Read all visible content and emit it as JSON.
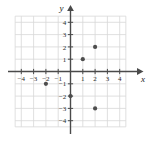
{
  "figure": {
    "name": "coordinate-plane-scatter",
    "width": 149,
    "height": 142,
    "background_color": "#ffffff"
  },
  "axes": {
    "x_label": "x",
    "y_label": "y",
    "x_tick_labels": [
      "−4",
      "−3",
      "−2",
      "−1",
      "1",
      "2",
      "3",
      "4"
    ],
    "y_tick_labels": [
      "4",
      "3",
      "2",
      "1",
      "−1",
      "−2",
      "−3",
      "−4"
    ],
    "axis_color": "#4a4a4a",
    "grid_color": "#d8d8d8"
  },
  "chart_data": {
    "type": "scatter",
    "title": "",
    "xlabel": "x",
    "ylabel": "y",
    "xlim": [
      -5,
      5
    ],
    "ylim": [
      -5,
      5
    ],
    "grid": true,
    "legend": false,
    "xticks": [
      -4,
      -3,
      -2,
      -1,
      1,
      2,
      3,
      4
    ],
    "yticks": [
      4,
      3,
      2,
      1,
      -1,
      -2,
      -3,
      -4
    ],
    "point_color": "#4d4d4d",
    "series": [
      {
        "name": "plotted points",
        "points": [
          {
            "x": -2,
            "y": -1
          },
          {
            "x": 0,
            "y": -2
          },
          {
            "x": 1,
            "y": 1
          },
          {
            "x": 2,
            "y": 2
          },
          {
            "x": 2,
            "y": -3
          }
        ]
      }
    ]
  }
}
